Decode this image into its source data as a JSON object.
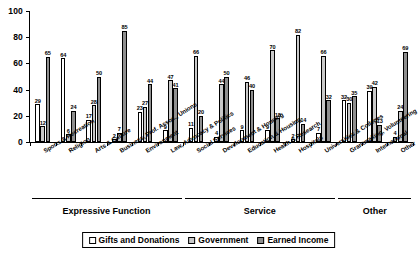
{
  "chart_data": {
    "type": "bar",
    "title": "",
    "xlabel": "",
    "ylabel": "",
    "ylim": [
      0,
      100
    ],
    "yticks": [
      0,
      20,
      40,
      60,
      80,
      100
    ],
    "grid": false,
    "legend_position": "bottom",
    "categories": [
      "Sports & Recreation",
      "Religion",
      "Arts & Culture",
      "Business, Prof. Assoc., Unions",
      "Environment",
      "Law, Advocacy & Politics",
      "Social Services",
      "Development & Housing",
      "Education & Housing",
      "Health & Research",
      "Hospitals",
      "Universities & Colleges",
      "Grantmaking, Volunteering",
      "International",
      "Other"
    ],
    "series": [
      {
        "name": "Gifts and Donations",
        "color": "#ffffff",
        "values": [
          29,
          64,
          17,
          2,
          23,
          9,
          11,
          4,
          9,
          9,
          2,
          7,
          32,
          39,
          4
        ]
      },
      {
        "name": "Government",
        "color": "#c9c9c9",
        "values": [
          12,
          6,
          28,
          7,
          27,
          47,
          66,
          44,
          46,
          70,
          82,
          66,
          30,
          42,
          24
        ]
      },
      {
        "name": "Earned Income",
        "color": "#8f8f8f",
        "values": [
          65,
          24,
          50,
          85,
          44,
          41,
          20,
          50,
          40,
          18,
          14,
          32,
          35,
          13,
          69
        ]
      }
    ],
    "sections": [
      {
        "label": "Expressive Function",
        "start_index": 0,
        "end_index": 5
      },
      {
        "label": "Service",
        "start_index": 6,
        "end_index": 11
      },
      {
        "label": "Other",
        "start_index": 12,
        "end_index": 14
      }
    ]
  }
}
